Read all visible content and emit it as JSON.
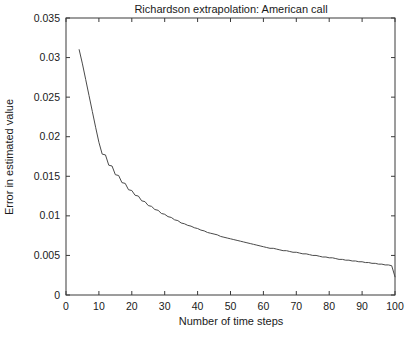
{
  "chart_data": {
    "type": "line",
    "title": "Richardson extrapolation: American call",
    "xlabel": "Number of time steps",
    "ylabel": "Error in estimated value",
    "xlim": [
      0,
      100
    ],
    "ylim": [
      0,
      0.035
    ],
    "grid": false,
    "legend": null,
    "xticks": [
      0,
      10,
      20,
      30,
      40,
      50,
      60,
      70,
      80,
      90,
      100
    ],
    "xtick_labels": [
      "0",
      "10",
      "20",
      "30",
      "40",
      "50",
      "60",
      "70",
      "80",
      "90",
      "100"
    ],
    "yticks": [
      0,
      0.005,
      0.01,
      0.015,
      0.02,
      0.025,
      0.03,
      0.035
    ],
    "ytick_labels": [
      "0",
      "0.005",
      "0.01",
      "0.015",
      "0.02",
      "0.025",
      "0.03",
      "0.035"
    ],
    "series": [
      {
        "name": "Richardson extrapolation error",
        "x": [
          4,
          5,
          6,
          7,
          8,
          9,
          10,
          11,
          12,
          13,
          14,
          15,
          16,
          17,
          18,
          19,
          20,
          21,
          22,
          23,
          24,
          25,
          26,
          27,
          28,
          29,
          30,
          31,
          32,
          33,
          34,
          35,
          36,
          37,
          38,
          39,
          40,
          41,
          42,
          43,
          44,
          45,
          46,
          47,
          48,
          49,
          50,
          51,
          52,
          53,
          54,
          55,
          56,
          57,
          58,
          59,
          60,
          61,
          62,
          63,
          64,
          65,
          66,
          67,
          68,
          69,
          70,
          71,
          72,
          73,
          74,
          75,
          76,
          77,
          78,
          79,
          80,
          81,
          82,
          83,
          84,
          85,
          86,
          87,
          88,
          89,
          90,
          91,
          92,
          93,
          94,
          95,
          96,
          97,
          98,
          99,
          100
        ],
        "values": [
          0.031,
          0.0292,
          0.0272,
          0.0252,
          0.0232,
          0.0212,
          0.0193,
          0.0178,
          0.0177,
          0.0164,
          0.0163,
          0.0152,
          0.0151,
          0.0142,
          0.0141,
          0.0133,
          0.0132,
          0.0126,
          0.0125,
          0.0119,
          0.0118,
          0.0113,
          0.0112,
          0.0108,
          0.0107,
          0.0103,
          0.0102,
          0.0099,
          0.0098,
          0.0095,
          0.0094,
          0.0091,
          0.009,
          0.0088,
          0.0087,
          0.0085,
          0.0084,
          0.0082,
          0.0081,
          0.0079,
          0.0078,
          0.0077,
          0.0076,
          0.0074,
          0.0073,
          0.0072,
          0.0071,
          0.007,
          0.0069,
          0.0068,
          0.0067,
          0.0066,
          0.0065,
          0.0064,
          0.0063,
          0.0062,
          0.0061,
          0.006,
          0.0059,
          0.0059,
          0.0058,
          0.0057,
          0.0056,
          0.0056,
          0.0055,
          0.0054,
          0.0054,
          0.0053,
          0.0052,
          0.0052,
          0.0051,
          0.005,
          0.005,
          0.0049,
          0.0048,
          0.0048,
          0.0047,
          0.0047,
          0.0046,
          0.0045,
          0.0045,
          0.0044,
          0.0044,
          0.0043,
          0.0043,
          0.0042,
          0.0042,
          0.0041,
          0.0041,
          0.004,
          0.004,
          0.0039,
          0.0039,
          0.0038,
          0.0038,
          0.0037,
          0.0023
        ]
      }
    ]
  }
}
